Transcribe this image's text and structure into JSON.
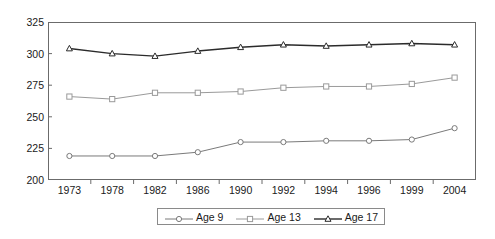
{
  "chart_data": {
    "type": "line",
    "title": "",
    "subtitle": "",
    "xlabel": "",
    "ylabel": "",
    "categories": [
      "1973",
      "1978",
      "1982",
      "1986",
      "1990",
      "1992",
      "1994",
      "1996",
      "1999",
      "2004"
    ],
    "series": [
      {
        "name": "Age 9",
        "marker": "circle",
        "color": "#7a7a7a",
        "values": [
          219,
          219,
          219,
          222,
          230,
          230,
          231,
          231,
          232,
          241
        ]
      },
      {
        "name": "Age 13",
        "marker": "square",
        "color": "#9a9a9a",
        "values": [
          266,
          264,
          269,
          269,
          270,
          273,
          274,
          274,
          276,
          281
        ]
      },
      {
        "name": "Age 17",
        "marker": "triangle",
        "color": "#2b2b2b",
        "values": [
          304,
          300,
          298,
          302,
          305,
          307,
          306,
          307,
          308,
          307
        ]
      }
    ],
    "ylim": [
      200,
      325
    ],
    "y_ticks": [
      200,
      225,
      250,
      275,
      300,
      325
    ],
    "grid": false,
    "legend_position": "bottom"
  },
  "legend": {
    "entries": [
      {
        "label": "Age 9"
      },
      {
        "label": "Age 13"
      },
      {
        "label": "Age 17"
      }
    ]
  }
}
